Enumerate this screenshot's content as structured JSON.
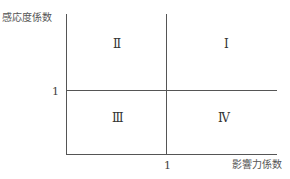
{
  "diagram": {
    "y_axis_title": "感応度係数",
    "x_axis_title": "影響力係数",
    "y_threshold_label": "1",
    "x_threshold_label": "1",
    "quadrants": {
      "top_right": "Ⅰ",
      "top_left": "Ⅱ",
      "bottom_left": "Ⅲ",
      "bottom_right": "Ⅳ"
    },
    "line_color": "#555555"
  }
}
